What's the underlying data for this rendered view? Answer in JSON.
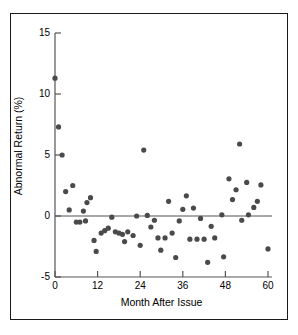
{
  "chart_data": {
    "type": "scatter",
    "title": "",
    "xlabel": "Month After Issue",
    "ylabel": "Abnormal Return (%)",
    "xlim": [
      0,
      61
    ],
    "ylim": [
      -5,
      15
    ],
    "xticks": [
      0,
      12,
      24,
      36,
      48,
      60
    ],
    "xtick_labels": [
      "0",
      "12",
      "24",
      "36",
      "48",
      "60"
    ],
    "yticks": [
      -5,
      0,
      5,
      10,
      15
    ],
    "ytick_labels": [
      "-5",
      "0",
      "5",
      "10",
      "15"
    ],
    "grid": false,
    "legend": null,
    "reference_lines": [
      {
        "axis": "y",
        "value": 0,
        "color": "#555555"
      }
    ],
    "marker": {
      "shape": "circle",
      "color": "#4a4a4a",
      "size_px": 5.2
    },
    "series": [
      {
        "name": "Abnormal Return",
        "points": [
          [
            0,
            11.3
          ],
          [
            1,
            7.3
          ],
          [
            2,
            5.0
          ],
          [
            3,
            2.0
          ],
          [
            4,
            0.5
          ],
          [
            5,
            2.5
          ],
          [
            6,
            -0.5
          ],
          [
            7,
            -0.5
          ],
          [
            8,
            0.4
          ],
          [
            8.6,
            -0.4
          ],
          [
            9,
            1.1
          ],
          [
            10,
            1.5
          ],
          [
            11,
            -2.0
          ],
          [
            11.6,
            -2.9
          ],
          [
            13,
            -1.4
          ],
          [
            14,
            -1.2
          ],
          [
            15,
            -1.0
          ],
          [
            16,
            -0.1
          ],
          [
            17,
            -1.3
          ],
          [
            18,
            -1.4
          ],
          [
            19,
            -1.5
          ],
          [
            19.6,
            -2.1
          ],
          [
            20.5,
            -1.3
          ],
          [
            22,
            -1.6
          ],
          [
            23,
            0.0
          ],
          [
            24,
            -2.4
          ],
          [
            25,
            5.4
          ],
          [
            26,
            0.05
          ],
          [
            27,
            -0.9
          ],
          [
            28,
            -0.35
          ],
          [
            29,
            -1.8
          ],
          [
            29.8,
            -2.8
          ],
          [
            31,
            -1.8
          ],
          [
            32,
            1.2
          ],
          [
            33,
            -1.4
          ],
          [
            34,
            -3.4
          ],
          [
            35,
            -0.4
          ],
          [
            36,
            0.55
          ],
          [
            37,
            1.65
          ],
          [
            38,
            -1.9
          ],
          [
            39,
            0.65
          ],
          [
            40,
            -1.9
          ],
          [
            41,
            -0.2
          ],
          [
            42,
            -1.9
          ],
          [
            43,
            -3.8
          ],
          [
            44,
            -0.85
          ],
          [
            45,
            -1.8
          ],
          [
            47,
            0.1
          ],
          [
            47.5,
            -3.35
          ],
          [
            49,
            3.05
          ],
          [
            50,
            1.35
          ],
          [
            51,
            2.15
          ],
          [
            52,
            5.9
          ],
          [
            52.6,
            -0.35
          ],
          [
            54,
            2.75
          ],
          [
            54.5,
            0.1
          ],
          [
            56,
            0.7
          ],
          [
            57,
            1.2
          ],
          [
            58,
            2.55
          ],
          [
            60,
            -2.7
          ]
        ]
      }
    ]
  },
  "axes": {
    "x_axis_name": "month-after-issue-axis",
    "y_axis_name": "abnormal-return-axis"
  }
}
